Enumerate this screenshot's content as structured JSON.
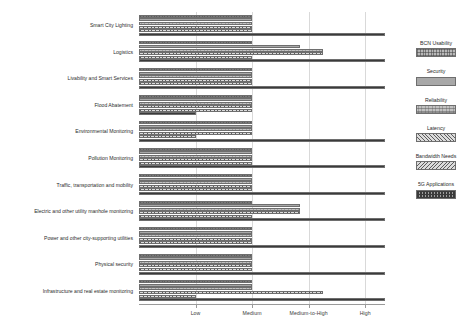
{
  "chart_data": {
    "type": "bar",
    "orientation": "horizontal",
    "title": "",
    "xlabel": "",
    "ylabel": "",
    "grid": true,
    "legend_position": "right",
    "x_tick_labels": [
      "Low",
      "Medium",
      "Medium-to-High",
      "High"
    ],
    "x_tick_values": [
      1,
      2,
      3,
      4
    ],
    "xlim": [
      0,
      4.35
    ],
    "categories": [
      "Smart City Lighting",
      "Logistics",
      "Livability and Smart Services",
      "Flood Abatement",
      "Environmental Monitoring",
      "Pollution Monitoring",
      "Traffic, transportation and mobility",
      "Electric and other utility manhole monitoring",
      "Power and other city-supporting utilities",
      "Physical security",
      "Infrastructure and real estate monitoring"
    ],
    "series": [
      {
        "name": "BCN Usability",
        "pattern": "grid-fine",
        "color": "#b9b9b9",
        "values": [
          2.0,
          2.0,
          2.0,
          2.0,
          2.0,
          2.0,
          2.0,
          2.0,
          2.0,
          2.0,
          2.0
        ]
      },
      {
        "name": "Security",
        "pattern": "horizontal-lines",
        "color": "#a8a8a8",
        "values": [
          2.0,
          2.85,
          2.0,
          2.0,
          2.0,
          2.0,
          2.0,
          2.85,
          2.0,
          2.0,
          2.0
        ]
      },
      {
        "name": "Reliability",
        "pattern": "dense-grid",
        "color": "#c2c2c2",
        "values": [
          2.0,
          3.25,
          2.0,
          2.0,
          2.0,
          2.0,
          2.0,
          2.85,
          2.0,
          2.0,
          2.0
        ]
      },
      {
        "name": "Latency",
        "pattern": "diagonal-forward",
        "color": "#dcdcdc",
        "values": [
          2.0,
          3.25,
          2.0,
          2.0,
          2.0,
          2.0,
          2.0,
          2.85,
          2.0,
          2.0,
          3.25
        ]
      },
      {
        "name": "Bandwidth Needs",
        "pattern": "diagonal-back",
        "color": "#dcdcdc",
        "values": [
          2.0,
          2.0,
          2.0,
          2.0,
          1.0,
          2.0,
          2.0,
          2.0,
          2.0,
          2.0,
          1.0
        ]
      },
      {
        "name": "5G Applications",
        "pattern": "crosshatch-dense",
        "values": [
          4.35,
          4.35,
          4.35,
          1.0,
          4.35,
          4.35,
          4.35,
          4.35,
          4.35,
          4.35,
          4.35
        ],
        "color": "#9d9d9d"
      }
    ]
  }
}
